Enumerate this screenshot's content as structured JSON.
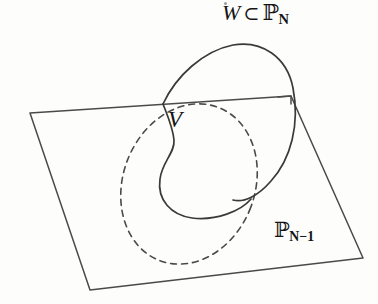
{
  "figure": {
    "background_color": "#fdfdfc",
    "ink_color": "#3a3a3a",
    "text_color": "#141414"
  },
  "labels": {
    "top": {
      "name": "W-subset-PN",
      "variable": "W",
      "operator": "⊂",
      "space_symbol": "ℙ",
      "space_subscript": "N",
      "plain_text": "W ⊂ ℙN"
    },
    "inner": {
      "name": "V",
      "text": "V"
    },
    "plane": {
      "name": "PN-minus-1",
      "space_symbol": "ℙ",
      "space_subscript": "N−1",
      "plain_text": "ℙN−1"
    }
  },
  "geometry": {
    "plane": {
      "shape": "parallelogram",
      "stroke": "#4a4a4a",
      "stroke_width": 1.5,
      "fill": "none",
      "corners": [
        [
          30,
          113
        ],
        [
          291,
          96
        ],
        [
          363,
          258
        ],
        [
          90,
          290
        ]
      ],
      "notch": [
        [
          278,
          97
        ],
        [
          291,
          96
        ],
        [
          291,
          104
        ]
      ]
    },
    "solid_curve": {
      "name": "W-outline",
      "description": "Solid outline of the surface W emerging above the plane",
      "stroke": "#3a3a3a",
      "stroke_width": 1.7,
      "fill": "none",
      "path": "M163,104 C178,74 205,50 235,45 C265,41 288,58 293,90 C299,125 290,160 270,182 C256,197 243,203 233,200"
    },
    "inner_curve": {
      "name": "V-teardrop",
      "description": "Solid teardrop outline of V on the visible side",
      "stroke": "#3a3a3a",
      "stroke_width": 1.7,
      "fill": "none",
      "path": "M163,104 C167,116 172,127 173,139 C174,152 163,161 161,178 C158,198 170,214 190,217 C214,221 240,211 250,199"
    },
    "dashed_ellipse": {
      "name": "hidden-intersection-ellipse",
      "description": "Dashed ellipse: the hidden part of the intersection V inside the plane",
      "stroke": "#4a4a4a",
      "stroke_width": 1.6,
      "dash_pattern": "6 5",
      "fill": "none",
      "center": [
        189,
        184
      ],
      "radius_x": 66,
      "radius_y": 82,
      "rotation_deg": 21
    }
  }
}
